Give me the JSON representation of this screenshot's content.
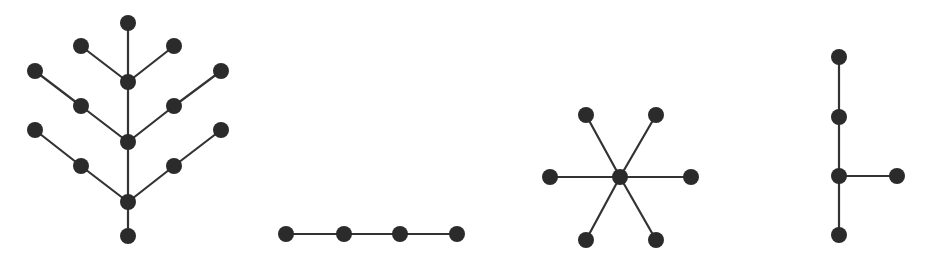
{
  "canvas": {
    "width": 938,
    "height": 265,
    "background": "#ffffff"
  },
  "style": {
    "node_color": "#2b2b2b",
    "edge_color": "#333333",
    "node_radius": 8,
    "edge_width": 2.2
  },
  "graphs": [
    {
      "name": "branched-tree",
      "nodes": [
        [
          128,
          23
        ],
        [
          81,
          46
        ],
        [
          174,
          46
        ],
        [
          128,
          82
        ],
        [
          35,
          71
        ],
        [
          221,
          71
        ],
        [
          81,
          106
        ],
        [
          174,
          106
        ],
        [
          128,
          142
        ],
        [
          35,
          130
        ],
        [
          221,
          130
        ],
        [
          81,
          166
        ],
        [
          174,
          166
        ],
        [
          128,
          202
        ],
        [
          128,
          236
        ]
      ],
      "edges": [
        [
          0,
          3
        ],
        [
          1,
          3
        ],
        [
          2,
          3
        ],
        [
          3,
          8
        ],
        [
          4,
          6
        ],
        [
          6,
          8
        ],
        [
          5,
          7
        ],
        [
          7,
          8
        ],
        [
          8,
          13
        ],
        [
          9,
          11
        ],
        [
          11,
          13
        ],
        [
          10,
          12
        ],
        [
          12,
          13
        ],
        [
          13,
          14
        ]
      ]
    },
    {
      "name": "path-graph",
      "nodes": [
        [
          286,
          234
        ],
        [
          344,
          234
        ],
        [
          400,
          234
        ],
        [
          457,
          234
        ]
      ],
      "edges": [
        [
          0,
          1
        ],
        [
          1,
          2
        ],
        [
          2,
          3
        ]
      ]
    },
    {
      "name": "star-graph",
      "nodes": [
        [
          620,
          177
        ],
        [
          586,
          115
        ],
        [
          656,
          115
        ],
        [
          550,
          177
        ],
        [
          691,
          177
        ],
        [
          586,
          240
        ],
        [
          656,
          240
        ]
      ],
      "edges": [
        [
          0,
          1
        ],
        [
          0,
          2
        ],
        [
          0,
          3
        ],
        [
          0,
          4
        ],
        [
          0,
          5
        ],
        [
          0,
          6
        ]
      ]
    },
    {
      "name": "spur-tree",
      "nodes": [
        [
          839,
          57
        ],
        [
          839,
          117
        ],
        [
          839,
          176
        ],
        [
          897,
          176
        ],
        [
          839,
          235
        ]
      ],
      "edges": [
        [
          0,
          1
        ],
        [
          1,
          2
        ],
        [
          2,
          3
        ],
        [
          2,
          4
        ]
      ]
    }
  ]
}
